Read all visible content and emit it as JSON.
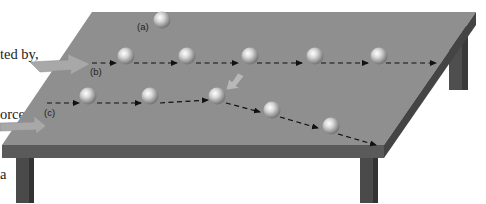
{
  "caption": {
    "lines": [
      "ted by,",
      "orce",
      "a"
    ]
  },
  "labels": {
    "a": "(a)",
    "b": "(b)",
    "c": "(c)"
  },
  "colors": {
    "table_top": "#8f8f8f",
    "table_edge": "#555555",
    "leg": "#4a4a4a",
    "arrow_fill": "#a8a8a8",
    "path_line": "#111111"
  },
  "scenarios": [
    {
      "id": "a",
      "description": "ball at rest",
      "balls": 1
    },
    {
      "id": "b",
      "description": "ball moving at constant velocity, pushed in from the left",
      "balls": 5
    },
    {
      "id": "c",
      "description": "ball deflected by a sideways push",
      "balls": 5
    }
  ]
}
